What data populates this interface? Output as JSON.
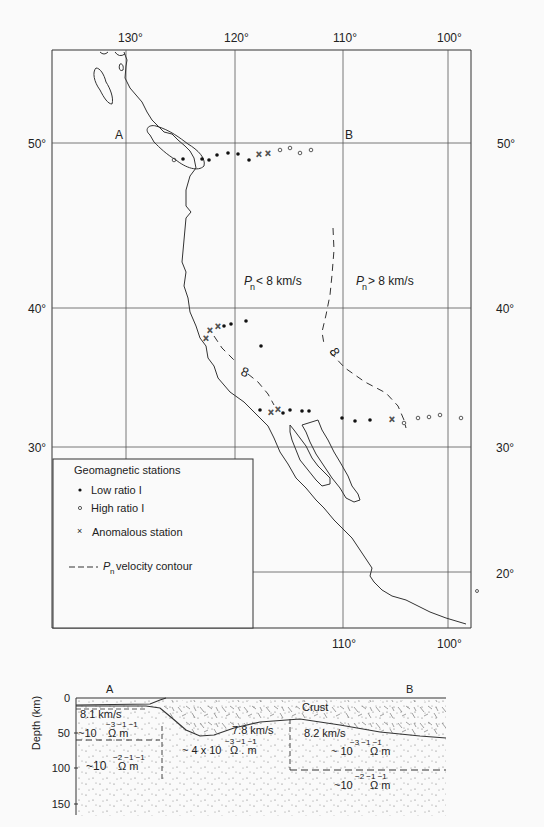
{
  "map": {
    "top_longitude_labels": [
      "130°",
      "120°",
      "110°",
      "100°"
    ],
    "bottom_longitude_labels": [
      "110°",
      "100°"
    ],
    "left_latitude_labels": [
      "50°",
      "40°",
      "30°"
    ],
    "right_latitude_labels": [
      "50°",
      "40°",
      "30°",
      "20°"
    ],
    "profile_start": "A",
    "profile_end": "B",
    "region_west_label_p": "P",
    "region_west_label_sub": "n",
    "region_west_label_rest": "< 8 km/s",
    "region_east_label_p": "P",
    "region_east_label_sub": "n",
    "region_east_label_rest": "> 8 km/s",
    "contour_label": "8"
  },
  "legend": {
    "title": "Geomagnetic stations",
    "items": [
      {
        "symbol": "filled-dot",
        "label": "Low ratio I"
      },
      {
        "symbol": "open-circle",
        "label": "High ratio I"
      },
      {
        "symbol": "cross",
        "label": "Anomalous station"
      },
      {
        "symbol": "dashed-line",
        "label_p": "P",
        "label_sub": "n",
        "label": "velocity contour"
      }
    ]
  },
  "cross_section": {
    "ylabel": "Depth (km)",
    "y_ticks": [
      "0",
      "50",
      "100",
      "150"
    ],
    "end_left": "A",
    "end_right": "B",
    "crust_label": "Crust",
    "layers": [
      {
        "velocity": "8.1 km/s",
        "resistivity_base": "~10",
        "exponents": "−3  −1  −1",
        "units": "Ω   m"
      },
      {
        "velocity": "",
        "resistivity_base": "~10",
        "exponents": "−2  −1  −1",
        "units": "Ω   m"
      },
      {
        "velocity": "7.8 km/s",
        "resistivity_base": "~ 4 x 10",
        "exponents": "−3  −1  −1",
        "units": "Ω . m"
      },
      {
        "velocity": "8.2 km/s",
        "resistivity_base": "~  10",
        "exponents": "−3  −1    −1",
        "units": "Ω    m"
      },
      {
        "velocity": "",
        "resistivity_base": "~10",
        "exponents": "−2  −1  −1",
        "units": "Ω    m"
      }
    ]
  }
}
